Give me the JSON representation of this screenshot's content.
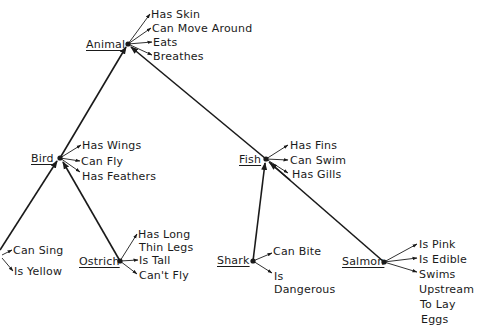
{
  "diagram": {
    "type": "semantic-network hierarchy",
    "nodes": {
      "animal": {
        "label": "Animal",
        "properties": [
          "Has Skin",
          "Can Move Around",
          "Eats",
          "Breathes"
        ]
      },
      "bird": {
        "label": "Bird",
        "properties": [
          "Has Wings",
          "Can Fly",
          "Has Feathers"
        ]
      },
      "fish": {
        "label": "Fish",
        "properties": [
          "Has Fins",
          "Can Swim",
          "Has Gills"
        ]
      },
      "canary": {
        "label": "",
        "properties": [
          "Can Sing",
          "Is Yellow"
        ]
      },
      "ostrich": {
        "label": "Ostrich",
        "properties": [
          "Has Long",
          "Thin Legs",
          "Is Tall",
          "Can't Fly"
        ]
      },
      "shark": {
        "label": "Shark",
        "properties": [
          "Can Bite",
          "Is",
          "Dangerous"
        ]
      },
      "salmon": {
        "label": "Salmon",
        "properties": [
          "Is Pink",
          "Is Edible",
          "Swims",
          "Upstream",
          "To Lay",
          "Eggs"
        ]
      }
    },
    "edges": [
      {
        "from": "bird",
        "to": "animal"
      },
      {
        "from": "fish",
        "to": "animal"
      },
      {
        "from": "canary",
        "to": "bird"
      },
      {
        "from": "ostrich",
        "to": "bird"
      },
      {
        "from": "shark",
        "to": "fish"
      },
      {
        "from": "salmon",
        "to": "fish"
      }
    ],
    "colors": {
      "ink": "#1a1a1a",
      "background": "#ffffff"
    }
  }
}
